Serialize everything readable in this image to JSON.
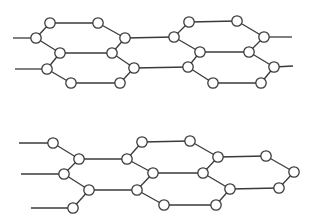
{
  "style": {
    "line_color": "#3a3a3a",
    "node_fill": "#ffffff",
    "background": "#ffffff",
    "node_radius": 5.2
  },
  "structures": [
    {
      "name": "upper-lattice",
      "nodes": [
        [
          50,
          23
        ],
        [
          98,
          23
        ],
        [
          36,
          38
        ],
        [
          125,
          38
        ],
        [
          60,
          53
        ],
        [
          112,
          53
        ],
        [
          47,
          69
        ],
        [
          134,
          68
        ],
        [
          71,
          83
        ],
        [
          120,
          83
        ],
        [
          189,
          22
        ],
        [
          237,
          21
        ],
        [
          174,
          37
        ],
        [
          264,
          37
        ],
        [
          200,
          52
        ],
        [
          249,
          52
        ],
        [
          188,
          67
        ],
        [
          274,
          67
        ],
        [
          213,
          83
        ],
        [
          261,
          83
        ]
      ],
      "edges": [
        [
          [
            13,
            38
          ],
          [
            36,
            38
          ]
        ],
        [
          [
            15,
            69
          ],
          [
            47,
            69
          ]
        ],
        [
          [
            36,
            38
          ],
          [
            50,
            23
          ]
        ],
        [
          [
            50,
            23
          ],
          [
            98,
            23
          ]
        ],
        [
          [
            98,
            23
          ],
          [
            125,
            38
          ]
        ],
        [
          [
            125,
            38
          ],
          [
            112,
            53
          ]
        ],
        [
          [
            112,
            53
          ],
          [
            60,
            53
          ]
        ],
        [
          [
            60,
            53
          ],
          [
            36,
            38
          ]
        ],
        [
          [
            112,
            53
          ],
          [
            134,
            68
          ]
        ],
        [
          [
            134,
            68
          ],
          [
            120,
            83
          ]
        ],
        [
          [
            120,
            83
          ],
          [
            71,
            83
          ]
        ],
        [
          [
            71,
            83
          ],
          [
            47,
            69
          ]
        ],
        [
          [
            47,
            69
          ],
          [
            60,
            53
          ]
        ],
        [
          [
            125,
            38
          ],
          [
            174,
            37
          ]
        ],
        [
          [
            134,
            68
          ],
          [
            188,
            67
          ]
        ],
        [
          [
            174,
            37
          ],
          [
            189,
            22
          ]
        ],
        [
          [
            189,
            22
          ],
          [
            237,
            21
          ]
        ],
        [
          [
            237,
            21
          ],
          [
            264,
            37
          ]
        ],
        [
          [
            264,
            37
          ],
          [
            249,
            52
          ]
        ],
        [
          [
            249,
            52
          ],
          [
            200,
            52
          ]
        ],
        [
          [
            200,
            52
          ],
          [
            174,
            37
          ]
        ],
        [
          [
            249,
            52
          ],
          [
            274,
            67
          ]
        ],
        [
          [
            274,
            67
          ],
          [
            261,
            83
          ]
        ],
        [
          [
            261,
            83
          ],
          [
            213,
            83
          ]
        ],
        [
          [
            213,
            83
          ],
          [
            188,
            67
          ]
        ],
        [
          [
            188,
            67
          ],
          [
            200,
            52
          ]
        ],
        [
          [
            264,
            37
          ],
          [
            292,
            37
          ]
        ],
        [
          [
            274,
            67
          ],
          [
            293,
            66
          ]
        ]
      ]
    },
    {
      "name": "lower-lattice",
      "nodes": [
        [
          53,
          143
        ],
        [
          79,
          159
        ],
        [
          127,
          159
        ],
        [
          142,
          142
        ],
        [
          64,
          174
        ],
        [
          89,
          190
        ],
        [
          137,
          190
        ],
        [
          153,
          173
        ],
        [
          73,
          208
        ],
        [
          190,
          141
        ],
        [
          218,
          157
        ],
        [
          266,
          156
        ],
        [
          294,
          172
        ],
        [
          203,
          173
        ],
        [
          230,
          189
        ],
        [
          279,
          188
        ],
        [
          164,
          205
        ],
        [
          216,
          205
        ]
      ],
      "edges": [
        [
          [
            19,
            143
          ],
          [
            53,
            143
          ]
        ],
        [
          [
            21,
            174
          ],
          [
            64,
            174
          ]
        ],
        [
          [
            31,
            208
          ],
          [
            73,
            208
          ]
        ],
        [
          [
            53,
            143
          ],
          [
            79,
            159
          ]
        ],
        [
          [
            79,
            159
          ],
          [
            127,
            159
          ]
        ],
        [
          [
            127,
            159
          ],
          [
            142,
            142
          ]
        ],
        [
          [
            142,
            142
          ],
          [
            190,
            141
          ]
        ],
        [
          [
            79,
            159
          ],
          [
            64,
            174
          ]
        ],
        [
          [
            64,
            174
          ],
          [
            89,
            190
          ]
        ],
        [
          [
            89,
            190
          ],
          [
            137,
            190
          ]
        ],
        [
          [
            137,
            190
          ],
          [
            153,
            173
          ]
        ],
        [
          [
            153,
            173
          ],
          [
            127,
            159
          ]
        ],
        [
          [
            89,
            190
          ],
          [
            73,
            208
          ]
        ],
        [
          [
            153,
            173
          ],
          [
            203,
            173
          ]
        ],
        [
          [
            190,
            141
          ],
          [
            218,
            157
          ]
        ],
        [
          [
            218,
            157
          ],
          [
            203,
            173
          ]
        ],
        [
          [
            218,
            157
          ],
          [
            266,
            156
          ]
        ],
        [
          [
            266,
            156
          ],
          [
            294,
            172
          ]
        ],
        [
          [
            294,
            172
          ],
          [
            279,
            188
          ]
        ],
        [
          [
            279,
            188
          ],
          [
            230,
            189
          ]
        ],
        [
          [
            230,
            189
          ],
          [
            203,
            173
          ]
        ],
        [
          [
            137,
            190
          ],
          [
            164,
            205
          ]
        ],
        [
          [
            164,
            205
          ],
          [
            216,
            205
          ]
        ],
        [
          [
            216,
            205
          ],
          [
            230,
            189
          ]
        ]
      ]
    }
  ]
}
